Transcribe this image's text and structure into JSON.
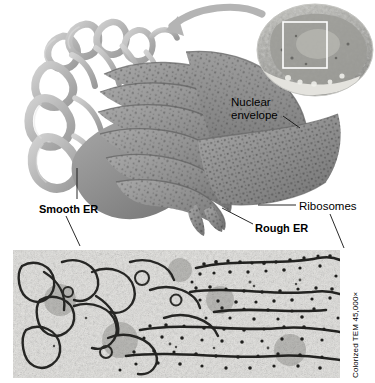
{
  "figure": {
    "title_visible": false,
    "type": "biology-textbook-figure",
    "panels": {
      "illustration": {
        "name": "ER illustration with cell locator inset",
        "description": "Cutaway drawing of endoplasmic reticulum: tubular smooth ER at left merging into stacked rough ER cisternae studded with ribosomes at right, continuous with the nuclear envelope"
      },
      "micrograph": {
        "name": "transmission electron micrograph of ER",
        "description": "Colorized TEM showing tubular smooth ER membranes on the left and flattened ribosome-studded rough ER cisternae on the right",
        "credit": "Colorized TEM 45,000×"
      },
      "inset": {
        "name": "whole-cell locator inset",
        "description": "Small cutaway cell drawing with a white rectangle marking the enlarged region"
      }
    },
    "labels": [
      {
        "id": "nuclear-envelope",
        "text": "Nuclear\nenvelope",
        "bold": false,
        "leader": true
      },
      {
        "id": "smooth-er",
        "text": "Smooth ER",
        "bold": true,
        "leader": true
      },
      {
        "id": "rough-er",
        "text": "Rough ER",
        "bold": true,
        "leader": true
      },
      {
        "id": "ribosomes",
        "text": "Ribosomes",
        "bold": false,
        "leader": true
      }
    ],
    "annotations": {
      "arrow": "curved gray arrow pointing from the cell inset to the enlarged ER illustration"
    },
    "colors": {
      "background": "#ffffff",
      "smooth_er": "#b9b9b9",
      "rough_er": "#8e8e8e",
      "ribosome_dot": "#3c3c3c",
      "leader_line": "#1a1a1a",
      "arrow": "#b0b0b0",
      "micrograph_light": "#e9e9e6",
      "micrograph_dark": "#2a2a28",
      "text": "#000000"
    }
  }
}
